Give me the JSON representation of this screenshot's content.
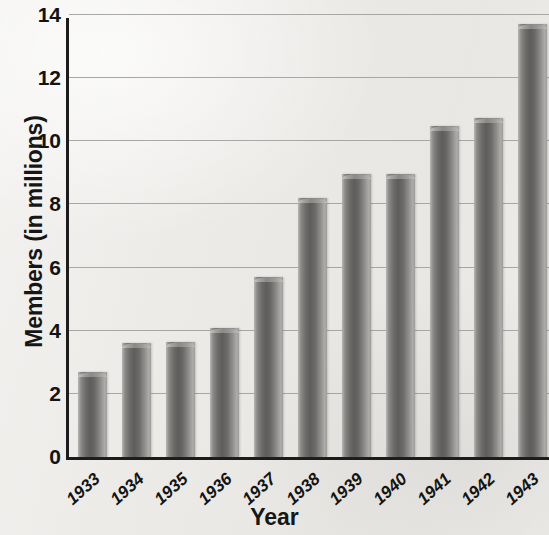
{
  "chart_data": {
    "type": "bar",
    "title": "",
    "xlabel": "Year",
    "ylabel": "Members (in millions)",
    "categories": [
      "1933",
      "1934",
      "1935",
      "1936",
      "1937",
      "1938",
      "1939",
      "1940",
      "1941",
      "1942",
      "1943"
    ],
    "values": [
      2.7,
      3.6,
      3.65,
      4.1,
      5.7,
      8.2,
      8.95,
      8.95,
      10.5,
      10.75,
      13.7
    ],
    "series": [
      {
        "name": "Members",
        "values": [
          2.7,
          3.6,
          3.65,
          4.1,
          5.7,
          8.2,
          8.95,
          8.95,
          10.5,
          10.75,
          13.7
        ]
      }
    ],
    "ylim": [
      0,
      14
    ],
    "ytick_labels": [
      "0",
      "2",
      "4",
      "6",
      "8",
      "10",
      "12",
      "14"
    ],
    "ytick_values": [
      0,
      2,
      4,
      6,
      8,
      10,
      12,
      14
    ],
    "grid": "horizontal",
    "legend": "none",
    "bar_color": "#6d6c6a",
    "grid_color": "#9a9a99",
    "axis_color": "#1c1c1c",
    "background_color": "#eeecea"
  }
}
